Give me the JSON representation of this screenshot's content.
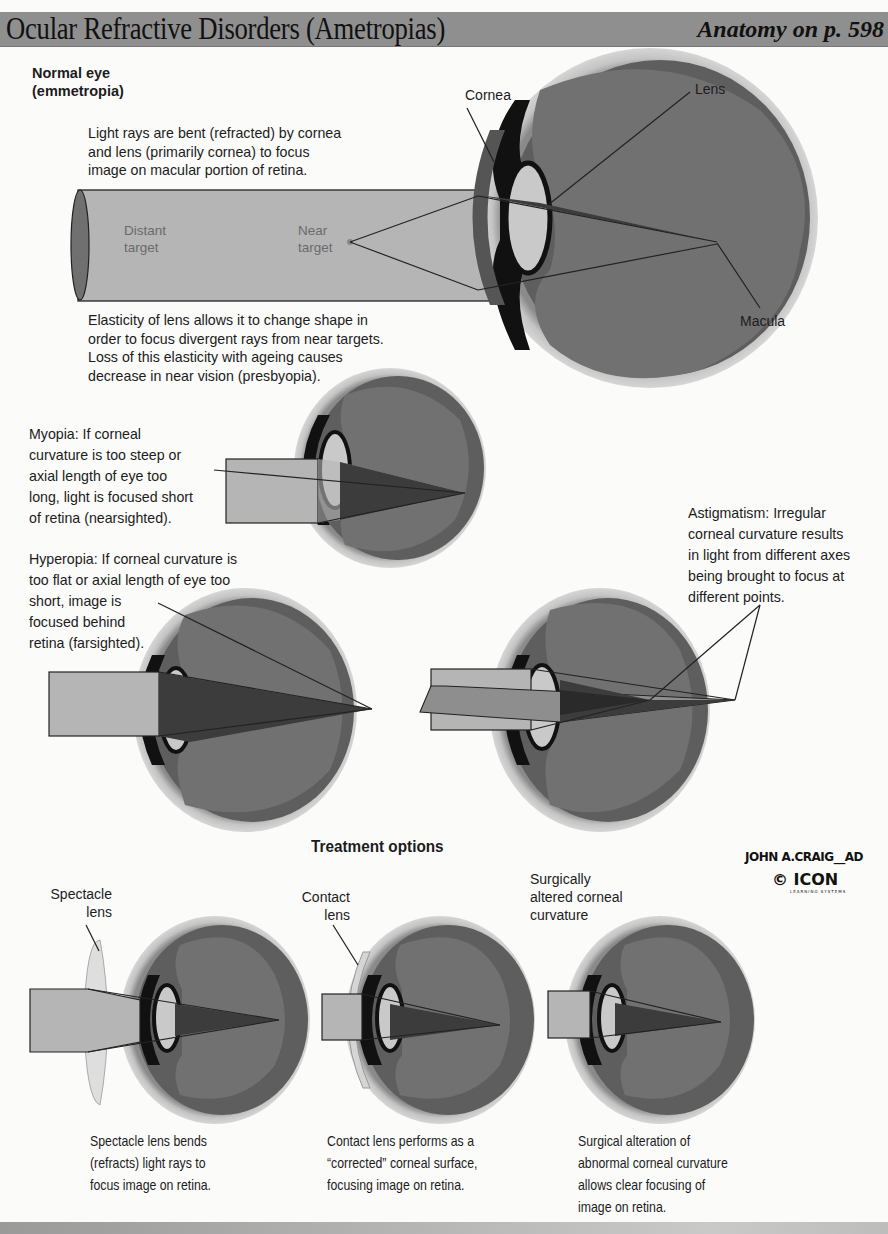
{
  "header": {
    "title": "Ocular Refractive Disorders (Ametropias)",
    "reference": "Anatomy on p. 598"
  },
  "normal_eye": {
    "heading": "Normal eye\n(emmetropia)",
    "description": "Light rays are bent (refracted) by cornea\nand lens (primarily cornea) to focus\nimage on macular portion of retina.",
    "beam_labels": {
      "distant": "Distant\ntarget",
      "near": "Near\ntarget"
    },
    "accommodation_note": "Elasticity of lens allows it to change shape in\norder to focus divergent rays from near targets.\nLoss of this elasticity with ageing causes\ndecrease in near vision (presbyopia).",
    "labels": {
      "cornea": "Cornea",
      "lens": "Lens",
      "macula": "Macula"
    }
  },
  "disorders": {
    "myopia": "Myopia: If corneal\ncurvature is too steep or\naxial length of eye too\nlong, light is focused short\nof retina (nearsighted).",
    "hyperopia": "Hyperopia: If corneal curvature is\ntoo flat or axial length of eye too\nshort, image is\nfocused behind\nretina (farsighted).",
    "astigmatism": "Astigmatism: Irregular\ncorneal curvature results\nin light from different axes\nbeing brought to focus at\ndifferent points."
  },
  "treatment": {
    "heading": "Treatment options",
    "options": [
      {
        "label": "Spectacle\nlens",
        "caption": "Spectacle lens bends\n(refracts) light rays to\nfocus image on retina."
      },
      {
        "label": "Contact\nlens",
        "caption": "Contact lens performs as a\n“corrected” corneal surface,\nfocusing image on retina."
      },
      {
        "label": "Surgically\naltered corneal\ncurvature",
        "caption": "Surgical alteration of\nabnormal corneal curvature\nallows clear focusing of\nimage on retina."
      }
    ]
  },
  "credits": {
    "artist": "JOHN A.CRAIG__AD",
    "publisher": "© ICON",
    "publisher_sub": "LEARNING SYSTEMS"
  },
  "colors": {
    "header_bg": "#8f8f8f",
    "beam": "#b5b5b5",
    "eye_interior": "#6f6f6f",
    "sclera": "#bdbdbd",
    "focus_cone": "#3c3c3c"
  }
}
